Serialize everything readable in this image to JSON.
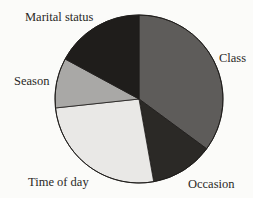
{
  "chart_data": {
    "type": "pie",
    "title": "",
    "start_angle_deg": 0,
    "direction": "clockwise",
    "categories": [
      "Class",
      "Occasion",
      "Time of day",
      "Season",
      "Marital status"
    ],
    "values": [
      35.1,
      12.1,
      26.1,
      9.6,
      17.1
    ],
    "unit": "percent (estimated from slice angles)",
    "colors": [
      "#5e5c5a",
      "#2b2926",
      "#e9e8e6",
      "#a9a8a6",
      "#1f1d1b"
    ],
    "legend": "none (direct labels outside slices)"
  },
  "labels": {
    "class": "Class",
    "occasion": "Occasion",
    "time_of_day": "Time of day",
    "season": "Season",
    "marital_status": "Marital status"
  }
}
